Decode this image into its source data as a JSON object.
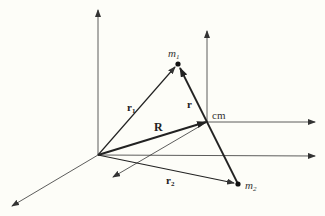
{
  "diagram": {
    "colors": {
      "background": "#fdfdf8",
      "ink": "#222222",
      "thin": "#333333"
    },
    "points": {
      "origin": {
        "x": 98,
        "y": 155
      },
      "cm": {
        "x": 207,
        "y": 122
      },
      "m1": {
        "x": 178,
        "y": 64
      },
      "m2": {
        "x": 238,
        "y": 184
      }
    },
    "labels": {
      "m1": {
        "base": "m",
        "sub": "1"
      },
      "m2": {
        "base": "m",
        "sub": "2"
      },
      "r1": {
        "base": "r",
        "sub": "1"
      },
      "r2": {
        "base": "r",
        "sub": "2"
      },
      "R": "R",
      "r": "r",
      "cm": "cm"
    },
    "vectors": [
      {
        "name": "r1",
        "from": "origin",
        "to": "m1"
      },
      {
        "name": "r2",
        "from": "origin",
        "to": "m2"
      },
      {
        "name": "R",
        "from": "origin",
        "to": "cm"
      },
      {
        "name": "r",
        "from": "m2",
        "to": "m1"
      }
    ],
    "axes": {
      "lab_frame": [
        "z (up)",
        "x (right)",
        "y (down-left)"
      ],
      "cm_frame": [
        "z' (up)",
        "x' (right)",
        "y' (down-left)"
      ]
    }
  }
}
